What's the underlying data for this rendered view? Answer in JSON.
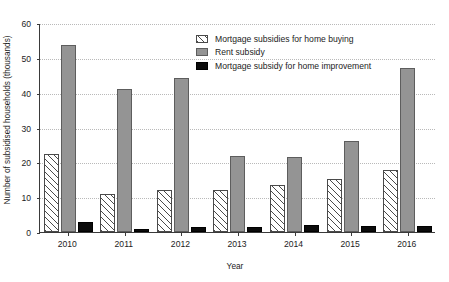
{
  "chart_data": {
    "type": "bar",
    "title": "",
    "xlabel": "Year",
    "ylabel": "Number of subsidised households (thousands)",
    "categories": [
      "2010",
      "2011",
      "2012",
      "2013",
      "2014",
      "2015",
      "2016"
    ],
    "ylim": [
      0,
      60
    ],
    "yticks": [
      "0",
      "10",
      "20",
      "30",
      "40",
      "50",
      "60"
    ],
    "grid": true,
    "legend_position": "top-center-right",
    "series": [
      {
        "name": "Mortgage subsidies for home buying",
        "pattern": "diagonal-hatch",
        "color": "#ffffff",
        "values": [
          22.5,
          11.0,
          12.0,
          12.0,
          13.5,
          15.3,
          17.7
        ]
      },
      {
        "name": "Rent subsidy",
        "pattern": "solid",
        "color": "#949494",
        "values": [
          53.8,
          41.2,
          44.1,
          21.7,
          21.5,
          26.2,
          47.2
        ]
      },
      {
        "name": "Mortgage subsidy for home improvement",
        "pattern": "solid",
        "color": "#0b0b0b",
        "values": [
          3.0,
          1.0,
          1.4,
          1.4,
          1.9,
          1.6,
          1.7
        ]
      }
    ]
  }
}
